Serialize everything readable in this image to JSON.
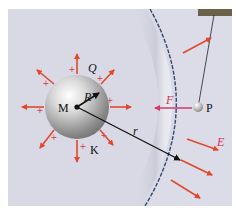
{
  "figure": {
    "background": "#d9d9e6",
    "labels": {
      "center": "M",
      "charge": "Q",
      "radius": "R",
      "distance": "r",
      "force": "F",
      "field": "E",
      "test_charge": "P",
      "point_k": "K"
    },
    "plus_sign": "+",
    "colors": {
      "field_arrow": "#e2492b",
      "force_arrow": "#d43a6a",
      "label_red": "#d4304a",
      "black": "#111111",
      "shell_edge": "#36496b",
      "hanger": "#6b6048"
    }
  }
}
